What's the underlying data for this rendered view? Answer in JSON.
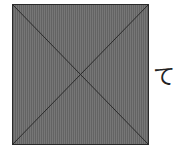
{
  "figure": {
    "shape": "square-with-diagonals",
    "fill_color": "#6e6e6e",
    "line_color": "#2a2a2a",
    "label": "て"
  }
}
